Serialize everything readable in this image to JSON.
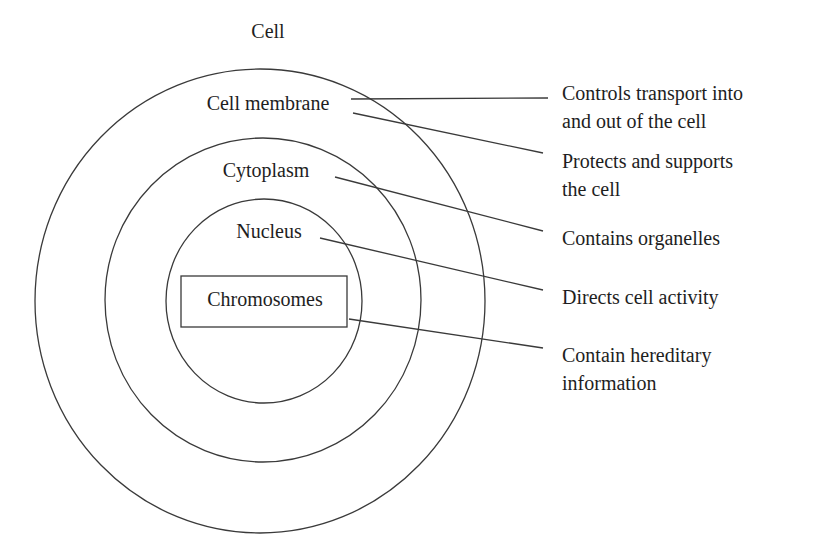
{
  "diagram": {
    "title": "Cell",
    "layers": [
      {
        "name": "Cell membrane",
        "description_lines": [
          "Controls transport into",
          "and out of the cell"
        ]
      },
      {
        "name": "Cell membrane",
        "description_lines": [
          "Protects and supports",
          "the cell"
        ]
      },
      {
        "name": "Cytoplasm",
        "description_lines": [
          "Contains organelles"
        ]
      },
      {
        "name": "Nucleus",
        "description_lines": [
          "Directs cell activity"
        ]
      },
      {
        "name": "Chromosomes",
        "description_lines": [
          "Contain hereditary",
          "information"
        ]
      }
    ],
    "labels": {
      "title": "Cell",
      "membrane": "Cell membrane",
      "cytoplasm": "Cytoplasm",
      "nucleus": "Nucleus",
      "chromosomes": "Chromosomes"
    },
    "descriptions": {
      "membrane_transport_1": "Controls transport into",
      "membrane_transport_2": "and out of the cell",
      "membrane_protect_1": "Protects and supports",
      "membrane_protect_2": "the cell",
      "cytoplasm": "Contains organelles",
      "nucleus": "Directs cell activity",
      "chromosomes_1": "Contain hereditary",
      "chromosomes_2": "information"
    },
    "stroke_color": "#3a3a3a",
    "text_color": "#1e1e1e"
  }
}
